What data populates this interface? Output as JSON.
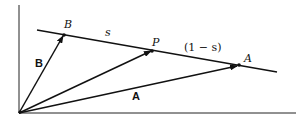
{
  "diagram": {
    "labels": {
      "point_B": "B",
      "segment_s": "s",
      "point_P": "P",
      "segment_one_minus_s": "(1 − s)",
      "point_A": "A",
      "vector_B": "B",
      "vector_A": "A"
    },
    "colors": {
      "ink": "#111111",
      "background": "#ffffff"
    }
  }
}
